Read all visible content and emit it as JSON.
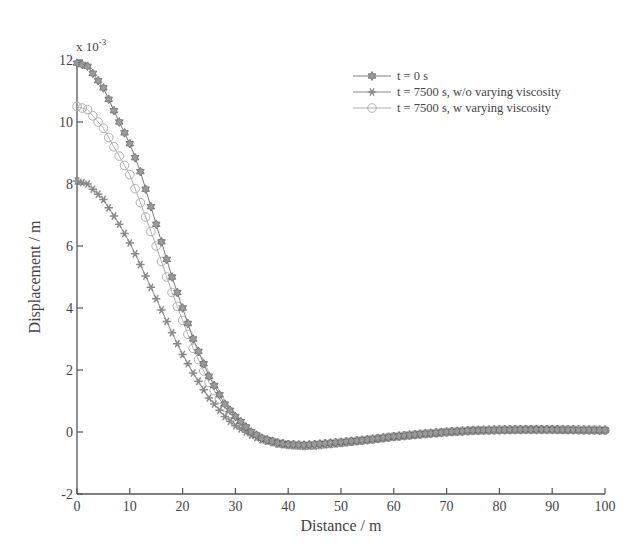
{
  "chart_data": {
    "type": "line",
    "title": "",
    "xlabel": "Distance / m",
    "ylabel": "Displacement / m",
    "y_multiplier_label": "x 10",
    "y_multiplier_exponent": "-3",
    "xlim": [
      0,
      100
    ],
    "ylim": [
      -2,
      12
    ],
    "x_ticks": [
      0,
      10,
      20,
      30,
      40,
      50,
      60,
      70,
      80,
      90,
      100
    ],
    "y_ticks": [
      -2,
      0,
      2,
      4,
      6,
      8,
      10,
      12
    ],
    "grid": false,
    "legend_position": "upper right",
    "series": [
      {
        "name": "t = 0 s",
        "marker": "hexagram",
        "color": "#7a7a7a",
        "key_x": [
          0,
          2,
          5,
          8,
          10,
          12,
          15,
          18,
          20,
          22,
          25,
          28,
          30,
          33,
          35,
          38,
          40,
          43,
          45,
          50,
          55,
          60,
          65,
          70,
          75,
          80,
          85,
          90,
          95,
          100
        ],
        "key_y": [
          11.9,
          11.8,
          11.1,
          10.0,
          9.3,
          8.4,
          6.7,
          5.0,
          4.0,
          3.0,
          1.8,
          0.9,
          0.5,
          0.0,
          -0.2,
          -0.35,
          -0.4,
          -0.42,
          -0.4,
          -0.33,
          -0.25,
          -0.15,
          -0.07,
          0.0,
          0.05,
          0.07,
          0.08,
          0.08,
          0.07,
          0.06
        ]
      },
      {
        "name": "t = 7500 s, w/o varying viscosity",
        "marker": "star",
        "color": "#8a8a8a",
        "key_x": [
          0,
          2,
          5,
          8,
          10,
          12,
          15,
          18,
          20,
          22,
          25,
          28,
          30,
          33,
          35,
          38,
          40,
          43,
          45,
          50,
          55,
          60,
          65,
          70,
          75,
          80,
          85,
          90,
          95,
          100
        ],
        "key_y": [
          8.1,
          8.0,
          7.5,
          6.7,
          6.1,
          5.4,
          4.3,
          3.2,
          2.5,
          1.9,
          1.1,
          0.5,
          0.2,
          -0.1,
          -0.25,
          -0.38,
          -0.42,
          -0.46,
          -0.45,
          -0.36,
          -0.26,
          -0.16,
          -0.08,
          -0.01,
          0.04,
          0.06,
          0.07,
          0.07,
          0.06,
          0.05
        ]
      },
      {
        "name": "t = 7500 s, w varying viscosity",
        "marker": "circle",
        "color": "#b0b0b0",
        "key_x": [
          0,
          2,
          5,
          8,
          10,
          12,
          15,
          18,
          20,
          22,
          25,
          28,
          30,
          33,
          35,
          38,
          40,
          43,
          45,
          50,
          55,
          60,
          65,
          70,
          75,
          80,
          85,
          90,
          95,
          100
        ],
        "key_y": [
          10.5,
          10.4,
          9.8,
          8.9,
          8.3,
          7.4,
          6.0,
          4.5,
          3.6,
          2.7,
          1.6,
          0.8,
          0.4,
          -0.05,
          -0.22,
          -0.36,
          -0.41,
          -0.44,
          -0.42,
          -0.34,
          -0.25,
          -0.15,
          -0.07,
          0.0,
          0.05,
          0.07,
          0.08,
          0.08,
          0.07,
          0.06
        ]
      }
    ]
  }
}
